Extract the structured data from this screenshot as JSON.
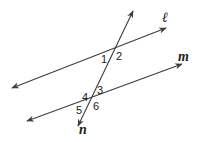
{
  "diagram": {
    "lines": [
      {
        "name": "ell",
        "label": "ℓ",
        "from": [
          12,
          88
        ],
        "to": [
          166,
          28
        ]
      },
      {
        "name": "m",
        "label": "m",
        "from": [
          27,
          121
        ],
        "to": [
          182,
          64
        ]
      },
      {
        "name": "n",
        "label": "n",
        "from": [
          133,
          11
        ],
        "to": [
          78,
          126
        ]
      }
    ],
    "angles": [
      {
        "id": "1",
        "label": "1",
        "x": 103,
        "y": 60
      },
      {
        "id": "2",
        "label": "2",
        "x": 117,
        "y": 58
      },
      {
        "id": "3",
        "label": "3",
        "x": 97,
        "y": 92
      },
      {
        "id": "4",
        "label": "4",
        "x": 82,
        "y": 101
      },
      {
        "id": "5",
        "label": "5",
        "x": 77,
        "y": 114
      },
      {
        "id": "6",
        "label": "6",
        "x": 93,
        "y": 110
      }
    ],
    "stroke_color": "#3c3c3c"
  }
}
